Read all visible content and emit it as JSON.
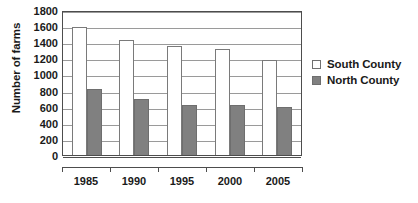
{
  "chart_data": {
    "type": "bar",
    "title": "",
    "xlabel": "",
    "ylabel": "Number of farms",
    "categories": [
      "1985",
      "1990",
      "1995",
      "2000",
      "2005"
    ],
    "series": [
      {
        "name": "South County",
        "values": [
          1590,
          1430,
          1355,
          1310,
          1185
        ],
        "color": "#ffffff"
      },
      {
        "name": "North County",
        "values": [
          820,
          690,
          625,
          615,
          595
        ],
        "color": "#808080"
      }
    ],
    "ylim": [
      0,
      1800
    ],
    "ytick_step": 200,
    "yticks": [
      "1800",
      "1600",
      "1400",
      "1200",
      "1000",
      "800",
      "600",
      "400",
      "200",
      "0"
    ],
    "grid": true,
    "legend_position": "right"
  },
  "legend": {
    "entries": [
      {
        "label": "South County",
        "swatch": "hollow-square-swatch"
      },
      {
        "label": "North County",
        "swatch": "filled-square-swatch"
      }
    ]
  },
  "colors": {
    "north_bar": "#808080",
    "south_bar": "#ffffff",
    "bar_outline": "#7a7a7a",
    "axis": "#4d4d4d",
    "gridline": "#9a9a9a",
    "text": "#1a1a1a"
  }
}
